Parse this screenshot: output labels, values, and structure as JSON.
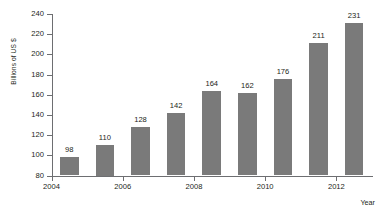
{
  "chart_data": {
    "type": "bar",
    "title": "",
    "xlabel": "Year",
    "ylabel": "Billions of US $",
    "categories": [
      "2004",
      "2005",
      "2006",
      "2007",
      "2008",
      "2009",
      "2010",
      "2011",
      "2012"
    ],
    "values": [
      98,
      110,
      128,
      142,
      164,
      162,
      176,
      211,
      231
    ],
    "value_labels": [
      "98",
      "110",
      "128",
      "142",
      "164",
      "162",
      "176",
      "211",
      "231"
    ],
    "ylim": [
      80,
      240
    ],
    "ytick_labels": [
      "240",
      "220",
      "200",
      "180",
      "160",
      "140",
      "120",
      "100",
      "80"
    ],
    "ytick_values": [
      240,
      220,
      200,
      180,
      160,
      140,
      120,
      100,
      80
    ],
    "xtick_labels": [
      "2004",
      "2006",
      "2008",
      "2010",
      "2012"
    ],
    "grid": false,
    "legend": false,
    "bar_color": "#7a7a7a",
    "axis_color": "#6d6e71",
    "text_color": "#231f20",
    "background_color": "#ffffff"
  }
}
